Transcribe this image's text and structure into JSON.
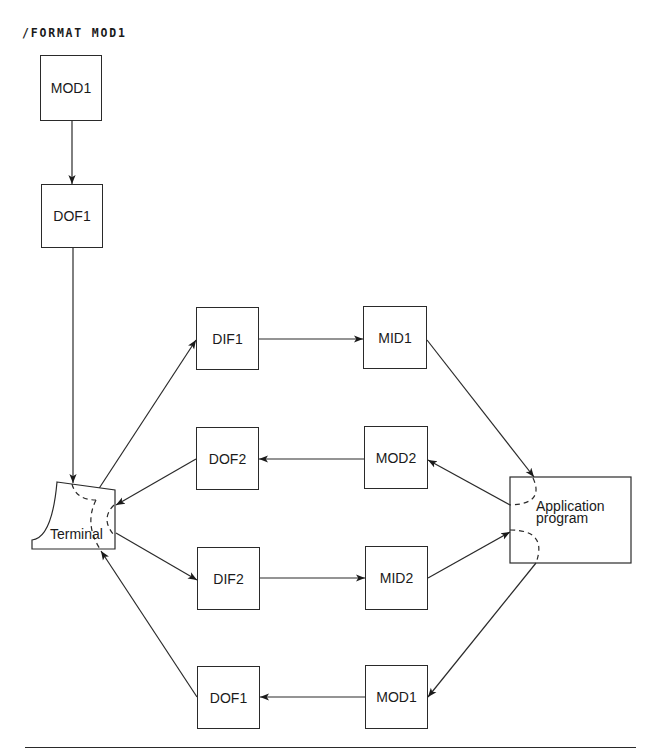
{
  "header": {
    "command": "/FORMAT MOD1"
  },
  "boxes": {
    "top_mod1": "MOD1",
    "top_dof1": "DOF1",
    "dif1": "DIF1",
    "mid1": "MID1",
    "dof2": "DOF2",
    "mod2": "MOD2",
    "dif2": "DIF2",
    "mid2": "MID2",
    "bottom_dof1": "DOF1",
    "bottom_mod1": "MOD1"
  },
  "terminal": {
    "label": "Terminal"
  },
  "application": {
    "line1": "Application",
    "line2": "program"
  },
  "flows": [
    {
      "from": "MOD1",
      "to": "DOF1"
    },
    {
      "from": "DOF1",
      "to": "Terminal"
    },
    {
      "from": "Terminal",
      "to": "DIF1"
    },
    {
      "from": "DIF1",
      "to": "MID1"
    },
    {
      "from": "MID1",
      "to": "Application program"
    },
    {
      "from": "Application program",
      "to": "MOD2"
    },
    {
      "from": "MOD2",
      "to": "DOF2"
    },
    {
      "from": "DOF2",
      "to": "Terminal"
    },
    {
      "from": "Terminal",
      "to": "DIF2"
    },
    {
      "from": "DIF2",
      "to": "MID2"
    },
    {
      "from": "MID2",
      "to": "Application program"
    },
    {
      "from": "Application program",
      "to": "MOD1"
    },
    {
      "from": "MOD1",
      "to": "DOF1"
    },
    {
      "from": "DOF1",
      "to": "Terminal"
    }
  ],
  "colors": {
    "line": "#2a2a2a",
    "background": "#ffffff"
  }
}
